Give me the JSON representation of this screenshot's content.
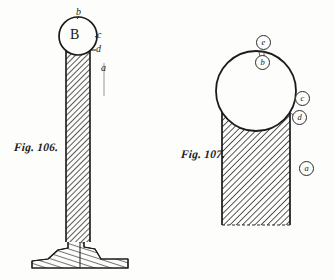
{
  "plate": {
    "background_color": "#fdfdfc",
    "ink_color": "#1b1b1b",
    "width": 334,
    "height": 280
  },
  "figures": [
    {
      "id": "fig-106",
      "caption": "Fig. 106.",
      "description": "Slender hatched column on a flared pedestal foot, surmounted by a circle containing the letter B",
      "sphere_label": "B",
      "labels": [
        {
          "key": "b",
          "text": "b",
          "style": "plain"
        },
        {
          "key": "c",
          "text": "c",
          "style": "plain"
        },
        {
          "key": "d",
          "text": "d",
          "style": "plain"
        },
        {
          "key": "a",
          "text": "a",
          "style": "plain"
        }
      ]
    },
    {
      "id": "fig-107",
      "caption": "Fig. 107.",
      "description": "Broad hatched column surmounted by a large plain circle, with circled reference letters",
      "labels": [
        {
          "key": "e",
          "text": "e",
          "style": "circled"
        },
        {
          "key": "b",
          "text": "b",
          "style": "circled"
        },
        {
          "key": "c",
          "text": "c",
          "style": "circled"
        },
        {
          "key": "d",
          "text": "d",
          "style": "circled"
        },
        {
          "key": "a",
          "text": "a",
          "style": "circled"
        }
      ]
    }
  ]
}
